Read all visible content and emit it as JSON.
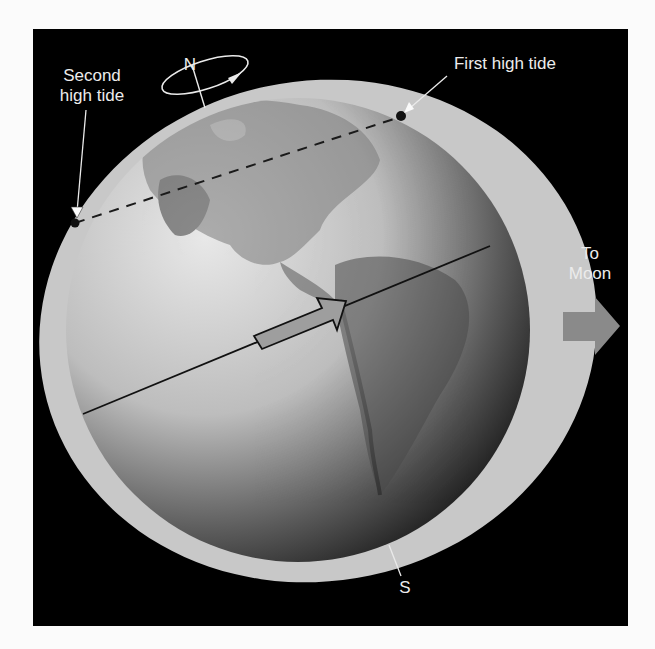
{
  "diagram": {
    "title": "",
    "labels": {
      "north": "N",
      "south": "S",
      "second_high_tide_line1": "Second",
      "second_high_tide_line2": "high tide",
      "first_high_tide": "First high tide",
      "to_moon_line1": "To",
      "to_moon_line2": "Moon"
    },
    "elements": {
      "earth": "globe showing North and South America",
      "tidal_bulge": "light gray ellipse around Earth, elongated toward Moon",
      "rotation_indicator": "elliptical arrow around north pole",
      "dashed_line": "connects second high tide to first high tide",
      "tidal_axis": "solid line through Earth toward Moon with hollow arrow",
      "moon_direction_arrow": "gray block arrow pointing right"
    },
    "colors": {
      "background": "#000000",
      "page": "#fbfbfb",
      "bulge": "#c8c8c8",
      "text": "#ececec",
      "moon_arrow": "#8a8a8a"
    }
  }
}
